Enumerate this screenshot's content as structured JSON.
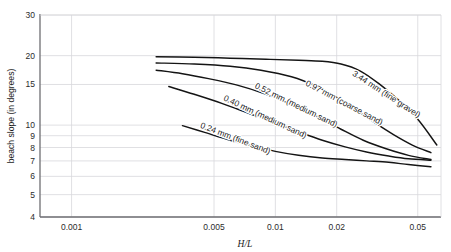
{
  "chart_data": {
    "type": "line",
    "title": "",
    "xlabel": "H/L",
    "ylabel": "beach slope (in degrees)",
    "xscale": "log",
    "yscale": "log",
    "xlim": [
      0.0007,
      0.065
    ],
    "ylim": [
      4,
      30
    ],
    "grid": true,
    "legend_position": "inline-labels",
    "xticks": [
      0.001,
      0.005,
      0.01,
      0.02,
      0.05
    ],
    "xtick_labels": [
      "0.001",
      "0.005",
      "0.01",
      "0.02",
      "0.05"
    ],
    "yticks": [
      4,
      5,
      6,
      7,
      8,
      9,
      10,
      15,
      20,
      30
    ],
    "ytick_labels": [
      "4",
      "5",
      "6",
      "7",
      "8",
      "9",
      "10",
      "15",
      "20",
      "30"
    ],
    "series": [
      {
        "name": "0.24 mm (fine sand)",
        "label": "0.24 mm (fine sand)",
        "label_x": 0.0063,
        "label_y": 8.55,
        "label_rotation": 21,
        "x": [
          0.0035,
          0.0045,
          0.006,
          0.008,
          0.01,
          0.013,
          0.017,
          0.022,
          0.028,
          0.036,
          0.045,
          0.058
        ],
        "y": [
          9.95,
          9.3,
          8.6,
          8.05,
          7.7,
          7.4,
          7.2,
          7.1,
          7.0,
          6.9,
          6.75,
          6.6
        ]
      },
      {
        "name": "0.40 mm (medium sand)",
        "label": "0.40 mm (medium sand)",
        "label_x": 0.0088,
        "label_y": 10.6,
        "label_rotation": 25,
        "x": [
          0.003,
          0.004,
          0.0055,
          0.0075,
          0.01,
          0.013,
          0.017,
          0.022,
          0.028,
          0.036,
          0.045,
          0.058
        ],
        "y": [
          14.7,
          13.6,
          12.4,
          11.2,
          10.2,
          9.35,
          8.6,
          8.05,
          7.65,
          7.35,
          7.15,
          7.05
        ]
      },
      {
        "name": "0.52 mm (medium sand)",
        "label": "0.52 mm (medium sand)",
        "label_x": 0.0125,
        "label_y": 11.9,
        "label_rotation": 26,
        "x": [
          0.0026,
          0.0035,
          0.0047,
          0.0065,
          0.0088,
          0.012,
          0.016,
          0.021,
          0.027,
          0.035,
          0.045,
          0.058
        ],
        "y": [
          17.3,
          16.7,
          15.9,
          14.9,
          13.7,
          12.3,
          10.9,
          9.6,
          8.6,
          7.9,
          7.4,
          7.1
        ]
      },
      {
        "name": "0.97 mm (coarse sand)",
        "label": "0.97 mm (coarse sand)",
        "label_x": 0.0215,
        "label_y": 12.2,
        "label_rotation": 28,
        "x": [
          0.0026,
          0.004,
          0.006,
          0.0085,
          0.012,
          0.016,
          0.02,
          0.025,
          0.031,
          0.038,
          0.047,
          0.058
        ],
        "y": [
          18.6,
          18.4,
          18.0,
          17.3,
          16.2,
          14.7,
          13.2,
          11.6,
          10.2,
          9.1,
          8.2,
          7.6
        ]
      },
      {
        "name": "3.44 mm (fine gravel)",
        "label": "3.44 mm (fine gravel)",
        "label_x": 0.0345,
        "label_y": 13.3,
        "label_rotation": 33,
        "x": [
          0.0026,
          0.004,
          0.006,
          0.009,
          0.013,
          0.017,
          0.021,
          0.026,
          0.032,
          0.04,
          0.05,
          0.062
        ],
        "y": [
          19.8,
          19.7,
          19.5,
          19.3,
          19.1,
          18.9,
          18.4,
          17.2,
          15.2,
          12.9,
          10.6,
          8.2
        ]
      }
    ]
  }
}
